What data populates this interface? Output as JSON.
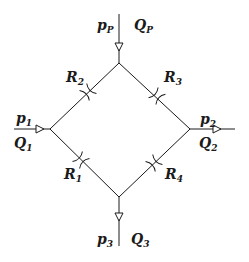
{
  "diagram": {
    "type": "hydraulic-bridge-network",
    "nodes": [
      {
        "id": "top",
        "x": 119,
        "y": 63
      },
      {
        "id": "left",
        "x": 50,
        "y": 129
      },
      {
        "id": "right",
        "x": 190,
        "y": 129
      },
      {
        "id": "bottom",
        "x": 119,
        "y": 197
      }
    ],
    "ports": [
      {
        "id": "inlet-p",
        "pressure": {
          "base": "p",
          "sub": "P"
        },
        "flow": {
          "base": "Q",
          "sub": "P"
        },
        "direction": "in",
        "node": "top"
      },
      {
        "id": "port-1",
        "pressure": {
          "base": "p",
          "sub": "1"
        },
        "flow": {
          "base": "Q",
          "sub": "1"
        },
        "direction": "in",
        "node": "left"
      },
      {
        "id": "port-2",
        "pressure": {
          "base": "p",
          "sub": "2"
        },
        "flow": {
          "base": "Q",
          "sub": "2"
        },
        "direction": "out",
        "node": "right"
      },
      {
        "id": "port-3",
        "pressure": {
          "base": "p",
          "sub": "3"
        },
        "flow": {
          "base": "Q",
          "sub": "3"
        },
        "direction": "out",
        "node": "bottom"
      }
    ],
    "resistors": [
      {
        "id": "R1",
        "label": {
          "base": "R",
          "sub": "1"
        },
        "edge": "left-bottom"
      },
      {
        "id": "R2",
        "label": {
          "base": "R",
          "sub": "2"
        },
        "edge": "left-top"
      },
      {
        "id": "R3",
        "label": {
          "base": "R",
          "sub": "3"
        },
        "edge": "top-right"
      },
      {
        "id": "R4",
        "label": {
          "base": "R",
          "sub": "4"
        },
        "edge": "right-bottom"
      }
    ],
    "line_color": "#1a1a1a"
  }
}
